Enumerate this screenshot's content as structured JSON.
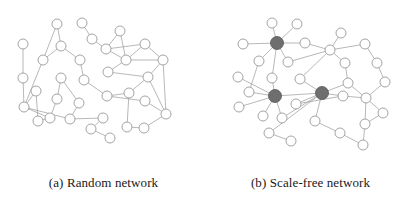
{
  "figure": {
    "width": 414,
    "height": 202,
    "background_color": "#ffffff",
    "node_stroke_color": "#9a9a9a",
    "node_fill_color": "#ffffff",
    "hub_fill_color": "#6e6e6e",
    "hub_stroke_color": "#555555",
    "edge_color": "#9a9a9a",
    "edge_width": 0.7,
    "node_radius": 5,
    "hub_radius": 6.5,
    "caption_color": "#1a1a1a"
  },
  "panels": [
    {
      "id": "random-network",
      "label": "(a) Random network",
      "origin_x": 0,
      "origin_y": 0,
      "nodes": [
        {
          "id": 0,
          "x": 23,
          "y": 44,
          "hub": false
        },
        {
          "id": 1,
          "x": 23,
          "y": 78,
          "hub": false
        },
        {
          "id": 2,
          "x": 57,
          "y": 24,
          "hub": false
        },
        {
          "id": 3,
          "x": 43,
          "y": 60,
          "hub": false
        },
        {
          "id": 4,
          "x": 61,
          "y": 46,
          "hub": false
        },
        {
          "id": 5,
          "x": 36,
          "y": 91,
          "hub": false
        },
        {
          "id": 6,
          "x": 61,
          "y": 78,
          "hub": false
        },
        {
          "id": 7,
          "x": 82,
          "y": 23,
          "hub": false
        },
        {
          "id": 8,
          "x": 80,
          "y": 60,
          "hub": false
        },
        {
          "id": 9,
          "x": 24,
          "y": 107,
          "hub": false
        },
        {
          "id": 10,
          "x": 57,
          "y": 99,
          "hub": false
        },
        {
          "id": 11,
          "x": 79,
          "y": 103,
          "hub": false
        },
        {
          "id": 12,
          "x": 50,
          "y": 118,
          "hub": false
        },
        {
          "id": 13,
          "x": 70,
          "y": 119,
          "hub": false
        },
        {
          "id": 14,
          "x": 84,
          "y": 80,
          "hub": false
        },
        {
          "id": 15,
          "x": 92,
          "y": 39,
          "hub": false
        },
        {
          "id": 16,
          "x": 120,
          "y": 31,
          "hub": false
        },
        {
          "id": 17,
          "x": 106,
          "y": 49,
          "hub": false
        },
        {
          "id": 18,
          "x": 108,
          "y": 72,
          "hub": false
        },
        {
          "id": 19,
          "x": 107,
          "y": 96,
          "hub": false
        },
        {
          "id": 20,
          "x": 126,
          "y": 60,
          "hub": false
        },
        {
          "id": 21,
          "x": 129,
          "y": 93,
          "hub": false
        },
        {
          "id": 22,
          "x": 145,
          "y": 44,
          "hub": false
        },
        {
          "id": 23,
          "x": 148,
          "y": 77,
          "hub": false
        },
        {
          "id": 24,
          "x": 163,
          "y": 60,
          "hub": false
        },
        {
          "id": 25,
          "x": 145,
          "y": 101,
          "hub": false
        },
        {
          "id": 26,
          "x": 166,
          "y": 114,
          "hub": false
        },
        {
          "id": 27,
          "x": 103,
          "y": 118,
          "hub": false
        },
        {
          "id": 28,
          "x": 91,
          "y": 129,
          "hub": false
        },
        {
          "id": 29,
          "x": 110,
          "y": 138,
          "hub": false
        },
        {
          "id": 30,
          "x": 127,
          "y": 127,
          "hub": false
        },
        {
          "id": 31,
          "x": 144,
          "y": 128,
          "hub": false
        },
        {
          "id": 32,
          "x": 38,
          "y": 121,
          "hub": false
        }
      ],
      "edges": [
        [
          0,
          1
        ],
        [
          2,
          4
        ],
        [
          2,
          3
        ],
        [
          4,
          8
        ],
        [
          3,
          9
        ],
        [
          1,
          9
        ],
        [
          5,
          9
        ],
        [
          9,
          12
        ],
        [
          9,
          13
        ],
        [
          6,
          10
        ],
        [
          10,
          12
        ],
        [
          11,
          13
        ],
        [
          7,
          15
        ],
        [
          15,
          17
        ],
        [
          16,
          17
        ],
        [
          17,
          20
        ],
        [
          17,
          22
        ],
        [
          20,
          24
        ],
        [
          22,
          24
        ],
        [
          18,
          20
        ],
        [
          19,
          21
        ],
        [
          21,
          23
        ],
        [
          23,
          24
        ],
        [
          23,
          26
        ],
        [
          25,
          26
        ],
        [
          18,
          23
        ],
        [
          14,
          19
        ],
        [
          21,
          30
        ],
        [
          27,
          28
        ],
        [
          28,
          29
        ],
        [
          30,
          31
        ],
        [
          31,
          26
        ],
        [
          32,
          12
        ],
        [
          5,
          32
        ],
        [
          8,
          14
        ],
        [
          16,
          20
        ],
        [
          6,
          11
        ],
        [
          13,
          27
        ],
        [
          19,
          25
        ],
        [
          24,
          26
        ],
        [
          22,
          20
        ],
        [
          3,
          4
        ]
      ]
    },
    {
      "id": "scale-free-network",
      "label": "(b) Scale-free network",
      "origin_x": 207,
      "origin_y": 0,
      "nodes": [
        {
          "id": 0,
          "x": 277,
          "y": 43,
          "hub": true
        },
        {
          "id": 1,
          "x": 275,
          "y": 96,
          "hub": true
        },
        {
          "id": 2,
          "x": 322,
          "y": 93,
          "hub": true
        },
        {
          "id": 3,
          "x": 243,
          "y": 44,
          "hub": false
        },
        {
          "id": 4,
          "x": 272,
          "y": 23,
          "hub": false
        },
        {
          "id": 5,
          "x": 297,
          "y": 24,
          "hub": false
        },
        {
          "id": 6,
          "x": 305,
          "y": 43,
          "hub": false
        },
        {
          "id": 7,
          "x": 259,
          "y": 61,
          "hub": false
        },
        {
          "id": 8,
          "x": 288,
          "y": 62,
          "hub": false
        },
        {
          "id": 9,
          "x": 238,
          "y": 77,
          "hub": false
        },
        {
          "id": 10,
          "x": 272,
          "y": 78,
          "hub": false
        },
        {
          "id": 11,
          "x": 300,
          "y": 79,
          "hub": false
        },
        {
          "id": 12,
          "x": 249,
          "y": 92,
          "hub": false
        },
        {
          "id": 13,
          "x": 239,
          "y": 107,
          "hub": false
        },
        {
          "id": 14,
          "x": 296,
          "y": 104,
          "hub": false
        },
        {
          "id": 15,
          "x": 263,
          "y": 116,
          "hub": false
        },
        {
          "id": 16,
          "x": 282,
          "y": 118,
          "hub": false
        },
        {
          "id": 17,
          "x": 269,
          "y": 133,
          "hub": false
        },
        {
          "id": 18,
          "x": 291,
          "y": 141,
          "hub": false
        },
        {
          "id": 19,
          "x": 315,
          "y": 121,
          "hub": false
        },
        {
          "id": 20,
          "x": 330,
          "y": 50,
          "hub": false
        },
        {
          "id": 21,
          "x": 341,
          "y": 33,
          "hub": false
        },
        {
          "id": 22,
          "x": 345,
          "y": 63,
          "hub": false
        },
        {
          "id": 23,
          "x": 365,
          "y": 44,
          "hub": false
        },
        {
          "id": 24,
          "x": 348,
          "y": 83,
          "hub": false
        },
        {
          "id": 25,
          "x": 377,
          "y": 63,
          "hub": false
        },
        {
          "id": 26,
          "x": 343,
          "y": 96,
          "hub": false
        },
        {
          "id": 27,
          "x": 366,
          "y": 98,
          "hub": false
        },
        {
          "id": 28,
          "x": 385,
          "y": 82,
          "hub": false
        },
        {
          "id": 29,
          "x": 383,
          "y": 113,
          "hub": false
        },
        {
          "id": 30,
          "x": 365,
          "y": 124,
          "hub": false
        },
        {
          "id": 31,
          "x": 340,
          "y": 133,
          "hub": false
        },
        {
          "id": 32,
          "x": 363,
          "y": 145,
          "hub": false
        }
      ],
      "edges": [
        [
          0,
          3
        ],
        [
          0,
          4
        ],
        [
          0,
          5
        ],
        [
          0,
          6
        ],
        [
          0,
          7
        ],
        [
          0,
          8
        ],
        [
          0,
          10
        ],
        [
          1,
          9
        ],
        [
          1,
          12
        ],
        [
          1,
          13
        ],
        [
          1,
          15
        ],
        [
          1,
          16
        ],
        [
          1,
          10
        ],
        [
          1,
          2
        ],
        [
          2,
          11
        ],
        [
          2,
          14
        ],
        [
          2,
          16
        ],
        [
          2,
          17
        ],
        [
          2,
          19
        ],
        [
          2,
          26
        ],
        [
          2,
          24
        ],
        [
          8,
          20
        ],
        [
          6,
          20
        ],
        [
          20,
          21
        ],
        [
          20,
          22
        ],
        [
          20,
          23
        ],
        [
          22,
          24
        ],
        [
          23,
          25
        ],
        [
          25,
          28
        ],
        [
          26,
          27
        ],
        [
          27,
          28
        ],
        [
          27,
          29
        ],
        [
          27,
          30
        ],
        [
          19,
          31
        ],
        [
          30,
          32
        ],
        [
          17,
          18
        ],
        [
          12,
          7
        ],
        [
          11,
          20
        ],
        [
          14,
          26
        ],
        [
          24,
          27
        ],
        [
          31,
          32
        ],
        [
          29,
          30
        ]
      ]
    }
  ]
}
